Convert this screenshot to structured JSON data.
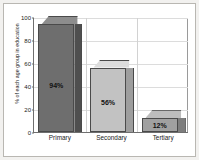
{
  "chart_data": {
    "type": "bar",
    "title": "",
    "subtitle": "",
    "xlabel": "",
    "ylabel": "% of each age group in education",
    "categories": [
      "Primary",
      "Secondary",
      "Tertiary"
    ],
    "values": [
      94,
      56,
      12
    ],
    "data_labels": [
      "94%",
      "56%",
      "12%"
    ],
    "ylim": [
      0,
      100
    ],
    "yticks": [
      0,
      20,
      40,
      60,
      80,
      100
    ],
    "ytick_labels": [
      "0",
      "20",
      "40",
      "60",
      "80",
      "100"
    ],
    "grid": {
      "horizontal": true,
      "vertical": true
    },
    "legend": {
      "visible": false,
      "position": "none",
      "entries": []
    },
    "style": {
      "three_d": true,
      "bar_colors": [
        "#6e6e6e",
        "#c2c2c2",
        "#a0a0a0"
      ],
      "bar_top_colors": [
        "#8d8d8d",
        "#dcdcdc",
        "#bdbdbd"
      ],
      "bar_side_colors": [
        "#4f4f4f",
        "#9e9e9e",
        "#7d7d7d"
      ],
      "bar_outline": "#4a4a4a",
      "axis_color": "#6f6f6f",
      "grid_color": "#dcdcdc",
      "plot_background": "#ffffff",
      "frame_border": "#b9b7b2",
      "page_background": "#f2f1ef",
      "text_color": "#1a1a1a"
    }
  }
}
